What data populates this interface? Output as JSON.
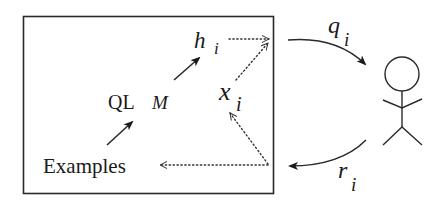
{
  "diagram": {
    "type": "interaction-loop",
    "system_box": {
      "nodes": {
        "examples": {
          "label": "Examples"
        },
        "learner": {
          "label_main": "QL",
          "label_var": "M"
        },
        "hypothesis": {
          "label": "h",
          "subscript": "i"
        },
        "example_x": {
          "label": "x",
          "subscript": "i"
        }
      }
    },
    "user": {
      "label": "user stick figure"
    },
    "edges": {
      "query": {
        "label": "q",
        "subscript": "i",
        "from": "system",
        "to": "user"
      },
      "response": {
        "label": "r",
        "subscript": "i",
        "from": "user",
        "to": "system"
      }
    },
    "colors": {
      "ink": "#1a1a1a",
      "background": "#ffffff"
    }
  }
}
